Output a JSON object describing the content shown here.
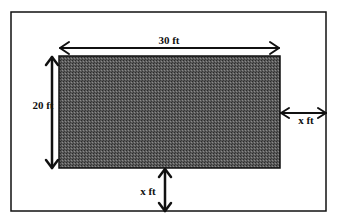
{
  "diagram": {
    "outer_border": {
      "x": 11,
      "y": 12,
      "width": 315,
      "height": 199
    },
    "inner_rect": {
      "x": 59,
      "y": 56,
      "width": 221,
      "height": 112,
      "fill": "#4a4a4a"
    },
    "labels": {
      "top_width": "30 ft",
      "left_height": "20 ft",
      "right_gap": "x ft",
      "bottom_gap": "x ft"
    },
    "colors": {
      "stroke": "#111111",
      "background": "#ffffff",
      "shaded_fill": "#4a4a4a"
    }
  }
}
